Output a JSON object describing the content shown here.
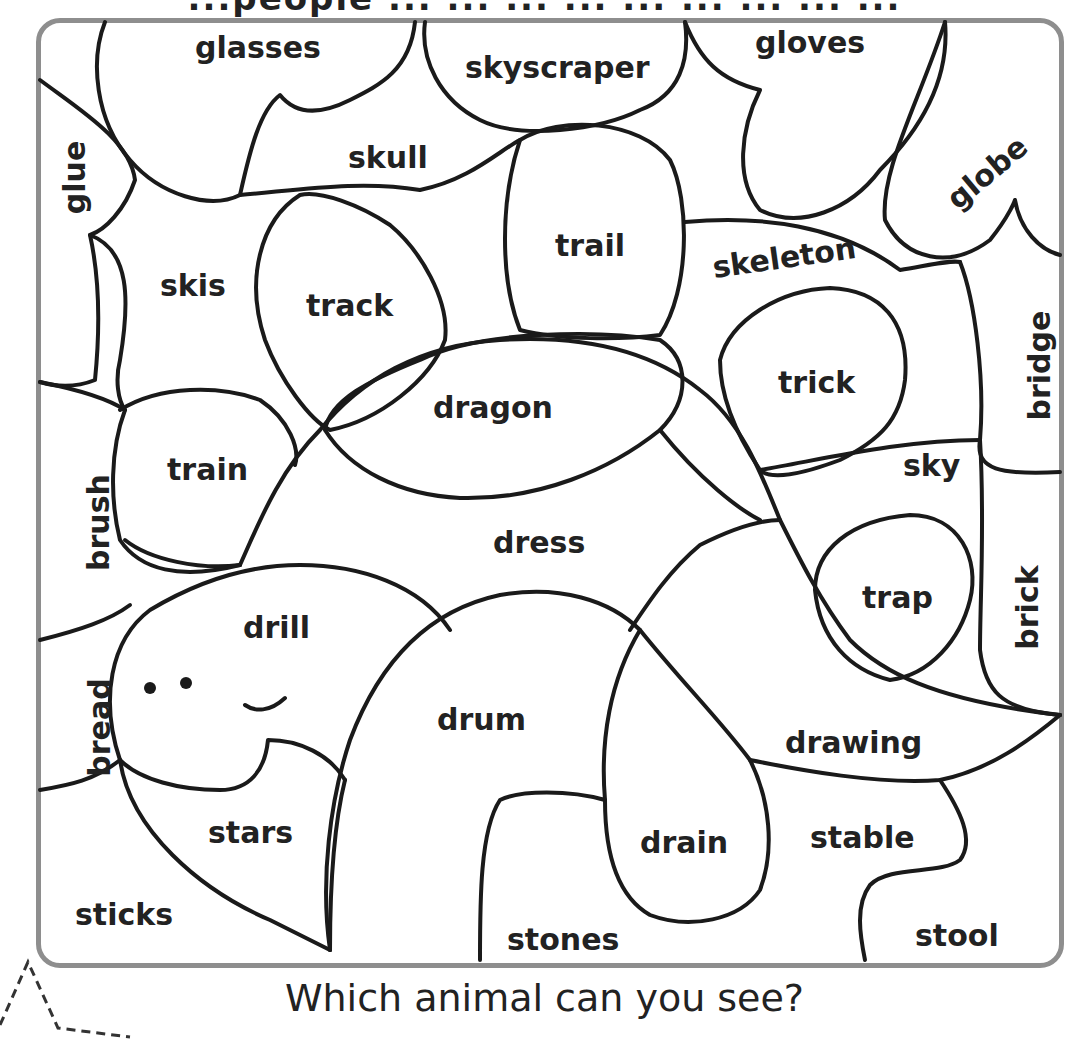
{
  "header": {
    "cut_text": "...people ... ... ... ... ... ... ... ... ..."
  },
  "question": "Which animal can you see?",
  "colors": {
    "frame": "#8e8e8e",
    "line": "#1a1a1a",
    "text": "#222222"
  },
  "words": [
    {
      "text": "glasses",
      "x": 195,
      "y": 30,
      "rot": 0
    },
    {
      "text": "skyscraper",
      "x": 465,
      "y": 50,
      "rot": 0
    },
    {
      "text": "gloves",
      "x": 755,
      "y": 25,
      "rot": 0
    },
    {
      "text": "glue",
      "x": 38,
      "y": 160,
      "rot": -90
    },
    {
      "text": "skull",
      "x": 348,
      "y": 140,
      "rot": 0
    },
    {
      "text": "globe",
      "x": 940,
      "y": 155,
      "rot": -40
    },
    {
      "text": "trail",
      "x": 555,
      "y": 228,
      "rot": 0
    },
    {
      "text": "skeleton",
      "x": 712,
      "y": 240,
      "rot": -8
    },
    {
      "text": "skis",
      "x": 160,
      "y": 268,
      "rot": 0
    },
    {
      "text": "track",
      "x": 306,
      "y": 288,
      "rot": 0
    },
    {
      "text": "bridge",
      "x": 985,
      "y": 348,
      "rot": -90
    },
    {
      "text": "trick",
      "x": 778,
      "y": 365,
      "rot": 0
    },
    {
      "text": "dragon",
      "x": 433,
      "y": 390,
      "rot": 0
    },
    {
      "text": "train",
      "x": 167,
      "y": 452,
      "rot": 0
    },
    {
      "text": "sky",
      "x": 903,
      "y": 448,
      "rot": 0
    },
    {
      "text": "brush",
      "x": 50,
      "y": 505,
      "rot": -90
    },
    {
      "text": "dress",
      "x": 493,
      "y": 525,
      "rot": 0
    },
    {
      "text": "trap",
      "x": 862,
      "y": 580,
      "rot": 0
    },
    {
      "text": "brick",
      "x": 985,
      "y": 590,
      "rot": -90
    },
    {
      "text": "drill",
      "x": 243,
      "y": 610,
      "rot": 0
    },
    {
      "text": "bread",
      "x": 50,
      "y": 710,
      "rot": -90
    },
    {
      "text": "drum",
      "x": 437,
      "y": 702,
      "rot": 0
    },
    {
      "text": "drawing",
      "x": 785,
      "y": 725,
      "rot": 0
    },
    {
      "text": "stars",
      "x": 208,
      "y": 815,
      "rot": 0
    },
    {
      "text": "stable",
      "x": 810,
      "y": 820,
      "rot": 0
    },
    {
      "text": "drain",
      "x": 640,
      "y": 825,
      "rot": 0
    },
    {
      "text": "sticks",
      "x": 75,
      "y": 897,
      "rot": 0
    },
    {
      "text": "stones",
      "x": 507,
      "y": 922,
      "rot": 0
    },
    {
      "text": "stool",
      "x": 915,
      "y": 918,
      "rot": 0
    }
  ]
}
